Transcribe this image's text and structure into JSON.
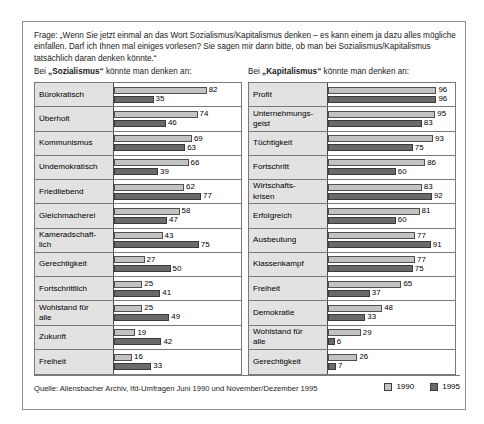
{
  "question": {
    "text": "Frage: „Wenn Sie jetzt einmal an das Wort Sozialismus/Kapitalismus denken – es kann einem ja dazu alles mögliche einfallen. Darf ich Ihnen mal einiges vorlesen? Sie sagen mir dann bitte, ob man bei Sozialismus/Kapitalismus tatsächlich daran denken könnte.“"
  },
  "captions": {
    "left_prefix": "Bei ",
    "left_term": "„Sozialismus“",
    "left_suffix": " könnte man denken an:",
    "right_prefix": "Bei ",
    "right_term": "„Kapitalismus“",
    "right_suffix": " könnte man denken an:"
  },
  "footer": {
    "source": "Quelle: Allensbacher Archiv, Ifd-Umfragen Juni 1990 und November/Dezember 1995",
    "legend": [
      {
        "label": "1990",
        "color": "#c3c3c3"
      },
      {
        "label": "1995",
        "color": "#6a6a6a"
      }
    ]
  },
  "chart_data": {
    "type": "bar",
    "xlabel": "",
    "ylabel": "",
    "xlim": [
      0,
      100
    ],
    "grid": false,
    "orientation": "horizontal",
    "legend_position": "bottom-right",
    "series_names": [
      "1990",
      "1995"
    ],
    "series_colors": [
      "#c3c3c3",
      "#6a6a6a"
    ],
    "panels": [
      {
        "name": "Sozialismus",
        "categories": [
          "Bürokratisch",
          "Überholt",
          "Kommunismus",
          "Undemokratisch",
          "Friedliebend",
          "Gleichmacherei",
          "Kameradschaft-lich",
          "Gerechtigkeit",
          "Fortschrittlich",
          "Wohlstand für alle",
          "Zukunft",
          "Freiheit"
        ],
        "rows": [
          {
            "label_lines": [
              "Bürokratisch"
            ],
            "v1990": 82,
            "v1995": 35
          },
          {
            "label_lines": [
              "Überholt"
            ],
            "v1990": 74,
            "v1995": 46
          },
          {
            "label_lines": [
              "Kommunismus"
            ],
            "v1990": 69,
            "v1995": 63
          },
          {
            "label_lines": [
              "Undemokratisch"
            ],
            "v1990": 66,
            "v1995": 39
          },
          {
            "label_lines": [
              "Friedliebend"
            ],
            "v1990": 62,
            "v1995": 77
          },
          {
            "label_lines": [
              "Gleichmacherei"
            ],
            "v1990": 58,
            "v1995": 47
          },
          {
            "label_lines": [
              "Kameradschaft-",
              "lich"
            ],
            "v1990": 43,
            "v1995": 75
          },
          {
            "label_lines": [
              "Gerechtigkeit"
            ],
            "v1990": 27,
            "v1995": 50
          },
          {
            "label_lines": [
              "Fortschrittlich"
            ],
            "v1990": 25,
            "v1995": 41
          },
          {
            "label_lines": [
              "Wohlstand für",
              "alle"
            ],
            "v1990": 25,
            "v1995": 49
          },
          {
            "label_lines": [
              "Zukunft"
            ],
            "v1990": 19,
            "v1995": 42
          },
          {
            "label_lines": [
              "Freiheit"
            ],
            "v1990": 16,
            "v1995": 33
          }
        ]
      },
      {
        "name": "Kapitalismus",
        "categories": [
          "Profit",
          "Unternehmungsgeist",
          "Tüchtigkeit",
          "Fortschritt",
          "Wirtschaftskrisen",
          "Erfolgreich",
          "Ausbeutung",
          "Klassenkampf",
          "Freiheit",
          "Demokratie",
          "Wohlstand für alle",
          "Gerechtigkeit"
        ],
        "rows": [
          {
            "label_lines": [
              "Profit"
            ],
            "v1990": 96,
            "v1995": 96
          },
          {
            "label_lines": [
              "Unternehmungs-",
              "geist"
            ],
            "v1990": 95,
            "v1995": 83
          },
          {
            "label_lines": [
              "Tüchtigkeit"
            ],
            "v1990": 93,
            "v1995": 75
          },
          {
            "label_lines": [
              "Fortschritt"
            ],
            "v1990": 86,
            "v1995": 60
          },
          {
            "label_lines": [
              "Wirtschafts-",
              "krisen"
            ],
            "v1990": 83,
            "v1995": 92
          },
          {
            "label_lines": [
              "Erfolgreich"
            ],
            "v1990": 81,
            "v1995": 60
          },
          {
            "label_lines": [
              "Ausbeutung"
            ],
            "v1990": 77,
            "v1995": 91
          },
          {
            "label_lines": [
              "Klassenkampf"
            ],
            "v1990": 77,
            "v1995": 75
          },
          {
            "label_lines": [
              "Freiheit"
            ],
            "v1990": 65,
            "v1995": 37
          },
          {
            "label_lines": [
              "Demokratie"
            ],
            "v1990": 48,
            "v1995": 33
          },
          {
            "label_lines": [
              "Wohlstand für",
              "alle"
            ],
            "v1990": 29,
            "v1995": 6
          },
          {
            "label_lines": [
              "Gerechtigkeit"
            ],
            "v1990": 26,
            "v1995": 7
          }
        ]
      }
    ]
  }
}
